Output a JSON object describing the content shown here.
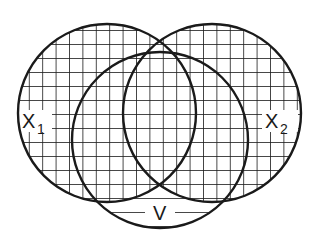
{
  "diagram": {
    "type": "venn",
    "stroke_color": "#1a1a1a",
    "background": "#ffffff",
    "sets": [
      {
        "id": "X1",
        "label": "X",
        "subscript": "1",
        "fill": "grid-hatch"
      },
      {
        "id": "X2",
        "label": "X",
        "subscript": "2",
        "fill": "grid-hatch"
      },
      {
        "id": "V",
        "label": "V",
        "fill": "horizontal-hatch"
      }
    ]
  },
  "labels": {
    "x1_main": "X",
    "x1_sub": "1",
    "x2_main": "X",
    "x2_sub": "2",
    "v": "V"
  }
}
